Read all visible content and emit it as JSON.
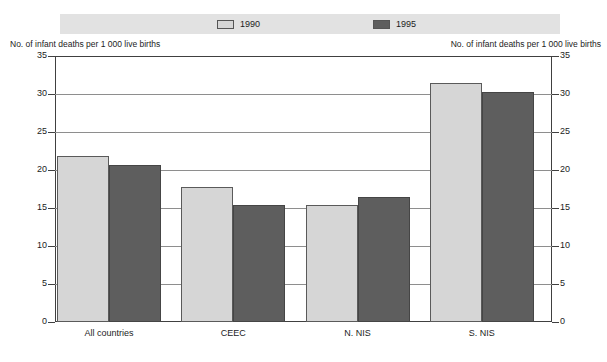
{
  "legend": {
    "entries": [
      {
        "label": "1990",
        "color": "#d6d6d6",
        "swatch": "legend-swatch-1990"
      },
      {
        "label": "1995",
        "color": "#5e5e5e",
        "swatch": "legend-swatch-1995"
      }
    ]
  },
  "axis": {
    "caption_left": "No. of infant deaths per 1 000 live births",
    "caption_right": "No. of infant deaths per 1 000 live births"
  },
  "chart_data": {
    "type": "bar",
    "title": "",
    "subtitle": "",
    "xlabel": "",
    "ylabel": "No. of infant deaths per 1 000 live births",
    "ylim": [
      0,
      35
    ],
    "yticks": [
      0,
      5,
      10,
      15,
      20,
      25,
      30,
      35
    ],
    "ytick_labels": [
      "0",
      "5",
      "10",
      "15",
      "20",
      "25",
      "30",
      "35"
    ],
    "grid": true,
    "legend_position": "top",
    "dual_y_axis": true,
    "categories": [
      "All countries",
      "CEEC",
      "N. NIS",
      "S. NIS"
    ],
    "series": [
      {
        "name": "1990",
        "color": "#d6d6d6",
        "values": [
          21.8,
          17.8,
          15.4,
          31.4
        ]
      },
      {
        "name": "1995",
        "color": "#5e5e5e",
        "values": [
          20.7,
          15.4,
          16.5,
          30.3
        ]
      }
    ]
  }
}
